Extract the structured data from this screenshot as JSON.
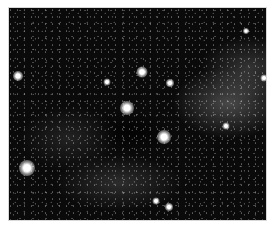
{
  "image": {
    "subject": "star field with Milky Way band",
    "background_color": "#0a0a0a",
    "border_color": "#ffffff",
    "bright_stars": [
      {
        "x": 17,
        "y": 75,
        "size": 10
      },
      {
        "x": 141,
        "y": 71,
        "size": 11
      },
      {
        "x": 169,
        "y": 82,
        "size": 8
      },
      {
        "x": 106,
        "y": 81,
        "size": 7
      },
      {
        "x": 126,
        "y": 107,
        "size": 14
      },
      {
        "x": 163,
        "y": 136,
        "size": 14
      },
      {
        "x": 26,
        "y": 167,
        "size": 16
      },
      {
        "x": 225,
        "y": 125,
        "size": 7
      },
      {
        "x": 155,
        "y": 200,
        "size": 7
      },
      {
        "x": 168,
        "y": 206,
        "size": 8
      },
      {
        "x": 263,
        "y": 77,
        "size": 7
      },
      {
        "x": 245,
        "y": 30,
        "size": 6
      }
    ]
  }
}
